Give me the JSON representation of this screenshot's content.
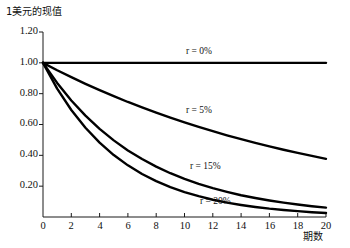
{
  "chart_data": {
    "type": "line",
    "title": "",
    "ylabel": "1美元的现值",
    "xlabel": "期数",
    "xlim": [
      0,
      20
    ],
    "ylim": [
      0,
      1.2
    ],
    "grid": false,
    "legend_position": "inline-annotations",
    "xticks": [
      "0",
      "2",
      "4",
      "6",
      "8",
      "10",
      "12",
      "14",
      "16",
      "18",
      "20"
    ],
    "xtick_values": [
      0,
      2,
      4,
      6,
      8,
      10,
      12,
      14,
      16,
      18,
      20
    ],
    "yticks": [
      "0.20",
      "0.40",
      "0.60",
      "0.80",
      "1.00",
      "1.20"
    ],
    "ytick_values": [
      0.2,
      0.4,
      0.6,
      0.8,
      1.0,
      1.2
    ],
    "x": [
      0,
      1,
      2,
      3,
      4,
      5,
      6,
      7,
      8,
      9,
      10,
      11,
      12,
      13,
      14,
      15,
      16,
      17,
      18,
      19,
      20
    ],
    "series": [
      {
        "name": "r = 0%",
        "rate": 0.0,
        "label": "r = 0%",
        "color": "#000000",
        "values": [
          1.0,
          1.0,
          1.0,
          1.0,
          1.0,
          1.0,
          1.0,
          1.0,
          1.0,
          1.0,
          1.0,
          1.0,
          1.0,
          1.0,
          1.0,
          1.0,
          1.0,
          1.0,
          1.0,
          1.0,
          1.0
        ]
      },
      {
        "name": "r = 5%",
        "rate": 0.05,
        "label": "r = 5%",
        "color": "#000000",
        "values": [
          1.0,
          0.952,
          0.907,
          0.864,
          0.823,
          0.784,
          0.746,
          0.711,
          0.677,
          0.645,
          0.614,
          0.585,
          0.557,
          0.53,
          0.505,
          0.481,
          0.458,
          0.436,
          0.416,
          0.396,
          0.377
        ]
      },
      {
        "name": "r = 15%",
        "rate": 0.15,
        "label": "r = 15%",
        "color": "#000000",
        "values": [
          1.0,
          0.87,
          0.756,
          0.658,
          0.572,
          0.497,
          0.432,
          0.376,
          0.327,
          0.284,
          0.247,
          0.215,
          0.187,
          0.163,
          0.141,
          0.123,
          0.107,
          0.093,
          0.081,
          0.07,
          0.061
        ]
      },
      {
        "name": "r = 20%",
        "rate": 0.2,
        "label": "r = 20%",
        "color": "#000000",
        "values": [
          1.0,
          0.833,
          0.694,
          0.579,
          0.482,
          0.402,
          0.335,
          0.279,
          0.233,
          0.194,
          0.162,
          0.135,
          0.112,
          0.093,
          0.078,
          0.065,
          0.054,
          0.045,
          0.038,
          0.031,
          0.026
        ]
      }
    ],
    "annotations": [
      {
        "text": "r = 0%",
        "x": 10.1,
        "y": 1.09
      },
      {
        "text": "r = 5%",
        "x": 10.1,
        "y": 0.695
      },
      {
        "text": "r = 15%",
        "x": 10.4,
        "y": 0.335
      },
      {
        "text": "r = 20%",
        "x": 11.1,
        "y": 0.115
      }
    ]
  },
  "axis": {
    "line_color": "#1a1a1a",
    "curve_color": "#000000"
  }
}
